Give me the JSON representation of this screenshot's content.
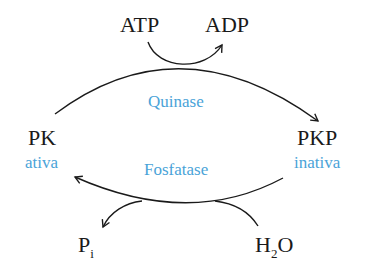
{
  "diagram": {
    "colors": {
      "text": "#1a1a1a",
      "accent": "#4aa3d8",
      "line": "#1a1a1a"
    },
    "nodes": {
      "atp": "ATP",
      "adp": "ADP",
      "pk": "PK",
      "pk_state": "ativa",
      "pkp": "PKP",
      "pkp_state": "inativa",
      "pi_main": "P",
      "pi_sub": "i",
      "h2o_h": "H",
      "h2o_sub": "2",
      "h2o_o": "O"
    },
    "enzymes": {
      "top": "Quinase",
      "bottom": "Fosfatase"
    },
    "edges": [
      {
        "from": "PK",
        "to": "PKP",
        "label": "Quinase",
        "cofactor_in": "ATP",
        "cofactor_out": "ADP"
      },
      {
        "from": "PKP",
        "to": "PK",
        "label": "Fosfatase",
        "cofactor_in": "H2O",
        "cofactor_out": "Pi"
      }
    ]
  }
}
